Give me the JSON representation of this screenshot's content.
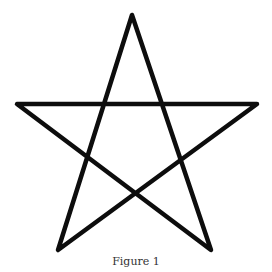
{
  "figure": {
    "caption": "Figure 1",
    "shape": "pentagram",
    "stroke_color": "#0d0d0d",
    "stroke_width": 4.5,
    "background": "#ffffff",
    "vertices": [
      {
        "name": "top",
        "x": 132,
        "y": 15
      },
      {
        "name": "bottom-right",
        "x": 211,
        "y": 250
      },
      {
        "name": "left",
        "x": 17,
        "y": 104
      },
      {
        "name": "right",
        "x": 257,
        "y": 104
      },
      {
        "name": "bottom-left",
        "x": 58,
        "y": 250
      }
    ]
  }
}
